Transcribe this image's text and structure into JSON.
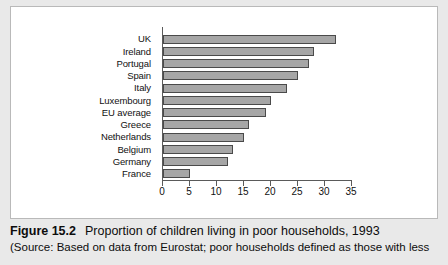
{
  "figure": {
    "caption_label": "Figure 15.2",
    "caption_title": "Proportion of children living in poor households, 1993",
    "caption_source": "(Source: Based on data from Eurostat; poor households defined as those with less"
  },
  "colors": {
    "bar_fill": "#a6a6a6",
    "bar_border": "#4a4a4a",
    "axis": "#5a5a5a",
    "panel_bg": "#ffffff",
    "page_bg": "#e9e9e9"
  },
  "chart_data": {
    "type": "bar",
    "orientation": "horizontal",
    "title": "",
    "xlabel": "",
    "ylabel": "",
    "xlim": [
      0,
      35
    ],
    "xticks": [
      0,
      5,
      10,
      15,
      20,
      25,
      30,
      35
    ],
    "grid": false,
    "legend": "none",
    "categories": [
      "UK",
      "Ireland",
      "Portugal",
      "Spain",
      "Italy",
      "Luxembourg",
      "EU average",
      "Greece",
      "Netherlands",
      "Belgium",
      "Germany",
      "France"
    ],
    "values": [
      32,
      28,
      27,
      25,
      23,
      20,
      19,
      16,
      15,
      13,
      12,
      5
    ]
  }
}
